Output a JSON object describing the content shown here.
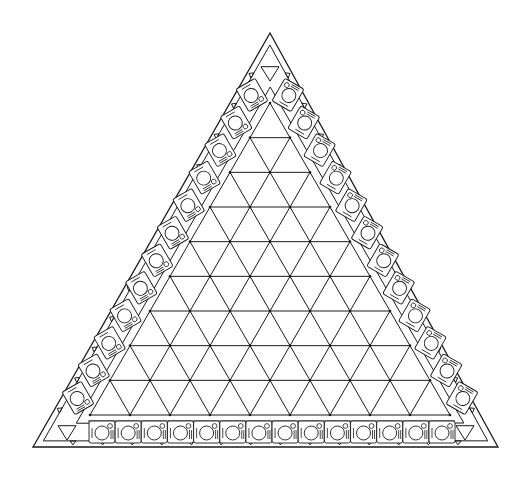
{
  "diagram": {
    "title": "Triangular banquet table plan",
    "stroke_color": "#1a1a1a",
    "background_color": "#ffffff",
    "outer_triangle": {
      "apex": [
        270,
        33
      ],
      "base_left": [
        33,
        447
      ],
      "base_right": [
        498,
        447
      ]
    },
    "inner_grid": {
      "apex": [
        270,
        103
      ],
      "base_left": [
        90,
        415
      ],
      "base_right": [
        450,
        415
      ],
      "divisions": 9,
      "type": "triangular-lattice"
    },
    "sides": [
      {
        "name": "left",
        "seat_count": 12
      },
      {
        "name": "right",
        "seat_count": 12
      },
      {
        "name": "bottom",
        "seat_count": 14
      }
    ],
    "corner_markers": [
      {
        "name": "top",
        "symbol": "down-triangle",
        "center": [
          270,
          73
        ]
      },
      {
        "name": "bottom-left",
        "symbol": "down-triangle",
        "center": [
          67,
          432
        ]
      },
      {
        "name": "bottom-right",
        "symbol": "down-triangle",
        "center": [
          465,
          432
        ]
      }
    ],
    "seat_symbol": {
      "parts": [
        "plate-circle",
        "glass-circle",
        "knife-line",
        "fork-lines"
      ]
    },
    "total_seats": 38
  }
}
